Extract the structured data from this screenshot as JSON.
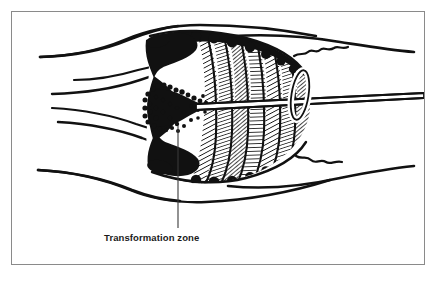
{
  "figure": {
    "type": "medical-illustration",
    "frame": {
      "border_color": "#8a8a8a",
      "background_color": "#ffffff"
    },
    "ink_color": "#111111",
    "annotations": [
      {
        "id": "transformation-zone",
        "label": "Transformation zone",
        "leader_line": {
          "x": 178,
          "y_top": 126,
          "y_bottom": 228
        },
        "label_position": {
          "x": 104,
          "y": 232
        }
      }
    ],
    "structures": [
      {
        "name": "anterior vaginal wall",
        "region": "upper-left"
      },
      {
        "name": "anterior vaginal fornix",
        "region": "mid-left"
      },
      {
        "name": "posterior vaginal fornix",
        "region": "mid-left-lower"
      },
      {
        "name": "posterior vaginal wall",
        "region": "lower-left"
      },
      {
        "name": "ectocervix with plicae palmatae",
        "region": "center"
      },
      {
        "name": "transformation zone",
        "region": "center-left"
      },
      {
        "name": "endocervical canal",
        "region": "center-right"
      },
      {
        "name": "probe / instrument shaft",
        "region": "right"
      },
      {
        "name": "oval ring marker",
        "region": "center-right"
      },
      {
        "name": "uterine corpus torn edge",
        "region": "right"
      }
    ]
  }
}
